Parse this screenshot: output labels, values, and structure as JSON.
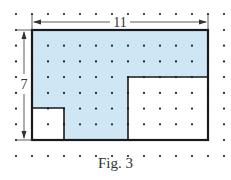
{
  "figure": {
    "caption": "Fig. 3",
    "width_label": "11",
    "height_label": "7",
    "grid_unit_px": 16,
    "colors": {
      "shaded": "#cfe6f5",
      "outline": "#1a1a1a",
      "dot": "#222222",
      "dimension_line": "#333333"
    },
    "outer_rectangle": {
      "width_units": 11,
      "height_units": 7
    },
    "cutouts": [
      {
        "name": "bottom-right-rectangle",
        "x_units": 6,
        "y_units": 3,
        "width_units": 5,
        "height_units": 4
      },
      {
        "name": "bottom-left-square",
        "x_units": 0,
        "y_units": 5,
        "width_units": 2,
        "height_units": 2
      }
    ]
  }
}
